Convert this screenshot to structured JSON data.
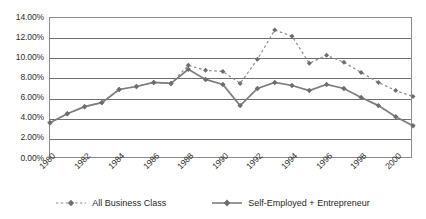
{
  "chart_data": {
    "type": "line",
    "title": "",
    "subtitle": "",
    "xlabel": "",
    "ylabel": "",
    "grid": true,
    "legend_position": "bottom",
    "xlim": [
      1980,
      2001
    ],
    "ylim": [
      0,
      14
    ],
    "y_tick_labels": [
      "14.00%",
      "12.00%",
      "10.00%",
      "8.00%",
      "6.00%",
      "4.00%",
      "2.00%",
      "0.00%"
    ],
    "y_tick_values": [
      14,
      12,
      10,
      8,
      6,
      4,
      2,
      0
    ],
    "x_tick_labels": [
      "1980",
      "1982",
      "1984",
      "1986",
      "1988",
      "1990",
      "1992",
      "1994",
      "1996",
      "1998",
      "2000"
    ],
    "x_tick_values": [
      1980,
      1982,
      1984,
      1986,
      1988,
      1990,
      1992,
      1994,
      1996,
      1998,
      2000
    ],
    "x": [
      1980,
      1981,
      1982,
      1983,
      1984,
      1985,
      1986,
      1987,
      1988,
      1989,
      1990,
      1991,
      1992,
      1993,
      1994,
      1995,
      1996,
      1997,
      1998,
      1999,
      2000,
      2001
    ],
    "series": [
      {
        "name": "All Business Class",
        "style": "dotted",
        "marker": "diamond",
        "color": "#8a8a8a",
        "values": [
          3.6,
          4.5,
          5.2,
          5.6,
          6.9,
          7.2,
          7.6,
          7.5,
          9.3,
          8.8,
          8.7,
          7.5,
          9.9,
          12.8,
          12.2,
          9.5,
          10.3,
          9.6,
          8.6,
          7.6,
          6.8,
          6.2
        ]
      },
      {
        "name": "Self-Employed + Entrepreneur",
        "style": "solid",
        "marker": "diamond",
        "color": "#7d7d7d",
        "values": [
          3.6,
          4.5,
          5.2,
          5.6,
          6.9,
          7.2,
          7.6,
          7.5,
          8.9,
          7.9,
          7.4,
          5.3,
          7.0,
          7.6,
          7.3,
          6.8,
          7.4,
          7.0,
          6.1,
          5.3,
          4.2,
          3.3
        ]
      }
    ]
  },
  "legend": {
    "items": [
      {
        "label": "All Business Class"
      },
      {
        "label": "Self-Employed + Entrepreneur"
      }
    ]
  }
}
